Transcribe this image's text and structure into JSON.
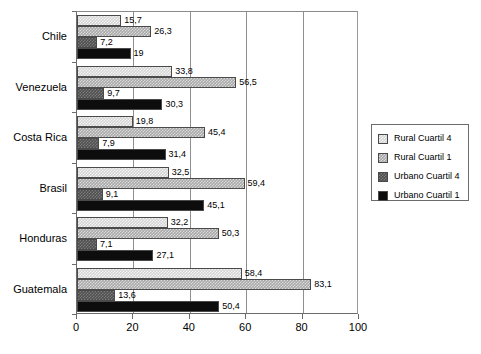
{
  "chart_data": {
    "type": "bar",
    "orientation": "horizontal",
    "title": "",
    "subtitle": "",
    "xlabel": "",
    "ylabel": "",
    "xlim": [
      0,
      100
    ],
    "xticks": [
      0,
      20,
      40,
      60,
      80,
      100
    ],
    "xtick_labels": [
      "0",
      "20",
      "40",
      "60",
      "80",
      "100"
    ],
    "grid": "vertical",
    "legend_position": "right",
    "decimal_separator": ",",
    "categories": [
      "Chile",
      "Venezuela",
      "Costa Rica",
      "Brasil",
      "Honduras",
      "Guatemala"
    ],
    "series": [
      {
        "name": "Rural Cuartil 4",
        "color": "#d4d4d4",
        "values": [
          15.7,
          33.8,
          19.8,
          32.5,
          32.2,
          58.4
        ],
        "labels": [
          "15,7",
          "33,8",
          "19,8",
          "32,5",
          "32,2",
          "58,4"
        ]
      },
      {
        "name": "Rural Cuartil 1",
        "color": "#a8a8a8",
        "values": [
          26.3,
          56.5,
          45.4,
          59.4,
          50.3,
          83.1
        ],
        "labels": [
          "26,3",
          "56,5",
          "45,4",
          "59,4",
          "50,3",
          "83,1"
        ]
      },
      {
        "name": "Urbano Cuartil 4",
        "color": "#4f4f4f",
        "values": [
          7.2,
          9.7,
          7.9,
          9.1,
          7.1,
          13.6
        ],
        "labels": [
          "7,2",
          "9,7",
          "7,9",
          "9,1",
          "7,1",
          "13,6"
        ]
      },
      {
        "name": "Urbano Cuartil 1",
        "color": "#0d0d0d",
        "values": [
          19,
          30.3,
          31.4,
          45.1,
          27.1,
          50.4
        ],
        "labels": [
          "19",
          "30,3",
          "31,4",
          "45,1",
          "27,1",
          "50,4"
        ]
      }
    ]
  },
  "legend": {
    "items": [
      {
        "label": "Rural Cuartil 4"
      },
      {
        "label": "Rural Cuartil 1"
      },
      {
        "label": "Urbano Cuartil 4"
      },
      {
        "label": "Urbano Cuartil 1"
      }
    ]
  }
}
